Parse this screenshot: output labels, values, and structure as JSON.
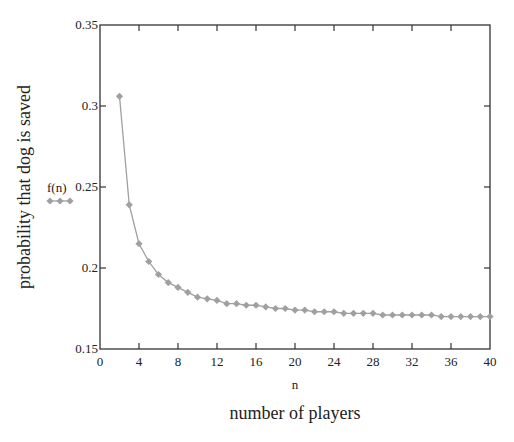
{
  "chart_data": {
    "type": "line",
    "title": "",
    "xlabel": "n",
    "xlabel_secondary": "number of players",
    "ylabel": "probability that dog is saved",
    "legend": [
      {
        "name": "f(n)",
        "marker": "diamond",
        "color": "#a0a0a0"
      }
    ],
    "legend_placement": "left-of-y-axis",
    "xlim": [
      0,
      40
    ],
    "ylim": [
      0.15,
      0.35
    ],
    "x_ticks": [
      0,
      4,
      8,
      12,
      16,
      20,
      24,
      28,
      32,
      36,
      40
    ],
    "x_tick_labels": [
      "0",
      "4",
      "8",
      "12",
      "16",
      "20",
      "24",
      "28",
      "32",
      "36",
      "40"
    ],
    "y_ticks": [
      0.15,
      0.2,
      0.25,
      0.3,
      0.35
    ],
    "y_tick_labels": [
      "0.15",
      "0.2",
      "0.25",
      "0.3",
      "0.35"
    ],
    "grid": false,
    "series": [
      {
        "name": "f(n)",
        "color": "#a0a0a0",
        "x": [
          2,
          3,
          4,
          5,
          6,
          7,
          8,
          9,
          10,
          11,
          12,
          13,
          14,
          15,
          16,
          17,
          18,
          19,
          20,
          21,
          22,
          23,
          24,
          25,
          26,
          27,
          28,
          29,
          30,
          31,
          32,
          33,
          34,
          35,
          36,
          37,
          38,
          39,
          40
        ],
        "values": [
          0.306,
          0.239,
          0.215,
          0.204,
          0.196,
          0.191,
          0.188,
          0.185,
          0.182,
          0.181,
          0.18,
          0.178,
          0.178,
          0.177,
          0.177,
          0.176,
          0.175,
          0.175,
          0.174,
          0.174,
          0.173,
          0.173,
          0.173,
          0.172,
          0.172,
          0.172,
          0.172,
          0.171,
          0.171,
          0.171,
          0.171,
          0.171,
          0.171,
          0.17,
          0.17,
          0.17,
          0.17,
          0.17,
          0.17
        ]
      }
    ]
  }
}
